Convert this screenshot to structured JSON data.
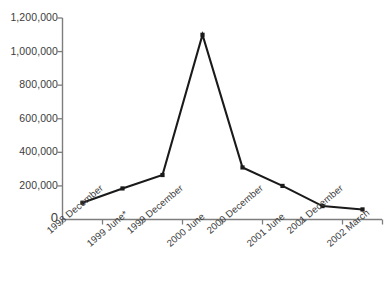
{
  "chart_data": {
    "type": "line",
    "title": "",
    "subtitle": "",
    "xlabel": "",
    "ylabel": "",
    "categories": [
      "1998 December",
      "1999 June*",
      "1999 December",
      "2000 June",
      "2000 December",
      "2001 June",
      "2001 December",
      "2002 March"
    ],
    "values": [
      100000,
      185000,
      265000,
      1100000,
      310000,
      200000,
      80000,
      60000
    ],
    "series": [
      {
        "name": "",
        "values": [
          100000,
          185000,
          265000,
          1100000,
          310000,
          200000,
          80000,
          60000
        ]
      }
    ],
    "ylim": [
      0,
      1200000
    ],
    "ytick_values": [
      0,
      200000,
      400000,
      600000,
      800000,
      1000000,
      1200000
    ],
    "ytick_labels": [
      "0",
      "200,000",
      "400,000",
      "600,000",
      "800,000",
      "1,000,000",
      "1,200,000"
    ],
    "grid": false,
    "legend": null,
    "legend_position": "none",
    "annotations": [
      "* asterisk on 1999 June category label"
    ],
    "marker": "square",
    "line_color": "#1a1a1a",
    "marker_color": "#1a1a1a",
    "axis_color": "#7a7a7a",
    "background_color": "#ffffff"
  }
}
